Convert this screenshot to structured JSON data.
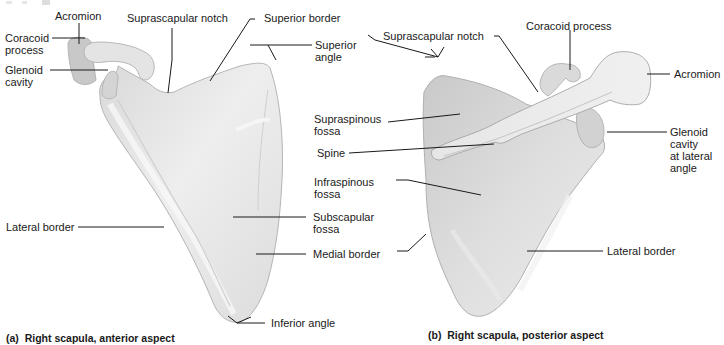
{
  "figure": {
    "panel_a": {
      "caption": "(a)  Right scapula, anterior aspect",
      "labels": {
        "acromion": "Acromion",
        "coracoid_process": "Coracoid\nprocess",
        "glenoid_cavity": "Glenoid\ncavity",
        "suprascapular_notch": "Suprascapular notch",
        "superior_border": "Superior border",
        "superior_angle": "Superior\nangle",
        "lateral_border": "Lateral border",
        "subscapular_fossa": "Subscapular\nfossa",
        "medial_border": "Medial border",
        "inferior_angle": "Inferior angle"
      }
    },
    "panel_b": {
      "caption": "(b)  Right scapula, posterior aspect",
      "labels": {
        "suprascapular_notch": "Suprascapular notch",
        "coracoid_process": "Coracoid process",
        "acromion": "Acromion",
        "supraspinous_fossa": "Supraspinous\nfossa",
        "spine": "Spine",
        "glenoid_cavity": "Glenoid\ncavity\nat lateral\nangle",
        "infraspinous_fossa": "Infraspinous\nfossa",
        "lateral_border": "Lateral border"
      }
    },
    "colors": {
      "bone_light": "#ececec",
      "bone_mid": "#d6d6d6",
      "bone_shadow": "#b8b8b8",
      "leader_line": "#1a1a1a",
      "text": "#1a1a1a"
    }
  }
}
